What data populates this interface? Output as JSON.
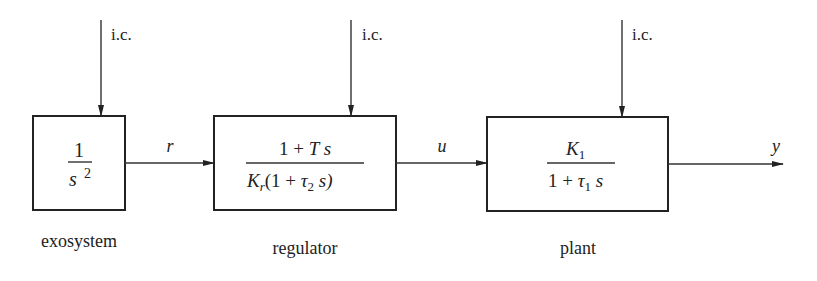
{
  "diagram": {
    "type": "block-diagram",
    "colors": {
      "line": "#222222",
      "background": "#ffffff"
    },
    "blocks": [
      {
        "id": "exosystem",
        "caption": "exosystem",
        "numerator": "1",
        "denominator_base": "s",
        "denominator_sup": "2",
        "input_label": "i.c."
      },
      {
        "id": "regulator",
        "caption": "regulator",
        "numerator": "1 + T s",
        "den_K": "K",
        "den_K_sub": "r",
        "den_rest_a": "(1 + ",
        "den_tau": "τ",
        "den_tau_sub": "2",
        "den_rest_b": " s)",
        "input_label": "i.c."
      },
      {
        "id": "plant",
        "caption": "plant",
        "num_K": "K",
        "num_K_sub": "1",
        "den_a": "1 + ",
        "den_tau": "τ",
        "den_tau_sub": "1",
        "den_s": " s",
        "input_label": "i.c."
      }
    ],
    "signals": [
      {
        "from": "exosystem",
        "to": "regulator",
        "label": "r"
      },
      {
        "from": "regulator",
        "to": "plant",
        "label": "u"
      },
      {
        "from": "plant",
        "to": "output",
        "label": "y"
      }
    ]
  }
}
